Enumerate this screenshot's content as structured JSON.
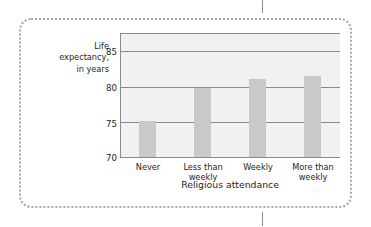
{
  "figure": {
    "frame_style": "dotted-rounded",
    "frame_color": "#a9a4b6",
    "background_color": "#ffffff"
  },
  "crop_marks": {
    "top_label": "crop-tick-top",
    "bottom_label": "crop-tick-bottom",
    "color": "#8e8e93"
  },
  "chart_data": {
    "type": "bar",
    "title": "",
    "xlabel": "Religious attendance",
    "ylabel": "Life\nexpectancy,\nin years",
    "categories": [
      "Never",
      "Less than\nweekly",
      "Weekly",
      "More than\nweekly"
    ],
    "values": [
      75.2,
      79.8,
      81.0,
      81.5
    ],
    "ylim": [
      70,
      87.5
    ],
    "yticks": [
      85,
      80,
      75,
      70
    ],
    "ytick_labels": [
      "85",
      "80",
      "75",
      "70"
    ],
    "grid": true,
    "grid_axis": "y",
    "legend": "none",
    "bar_color": "#c9c9c9",
    "plot_background": "#f1f1f1",
    "axis_color": "#8a8a8a"
  }
}
